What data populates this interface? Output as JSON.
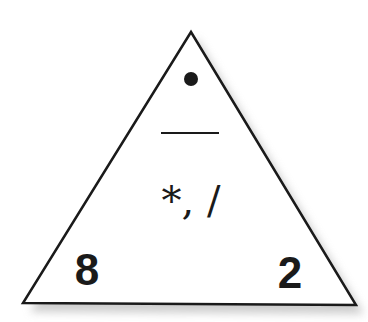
{
  "diagram": {
    "type": "fact-family-triangle",
    "top_value": "•",
    "top_meaning": "blank (unknown value)",
    "bottom_left": "8",
    "bottom_right": "2",
    "operations": "*, /",
    "divider": "fraction-bar",
    "colors": {
      "stroke": "#1a1a1a",
      "fill": "#ffffff",
      "shadow": "#bdbdbd"
    }
  }
}
